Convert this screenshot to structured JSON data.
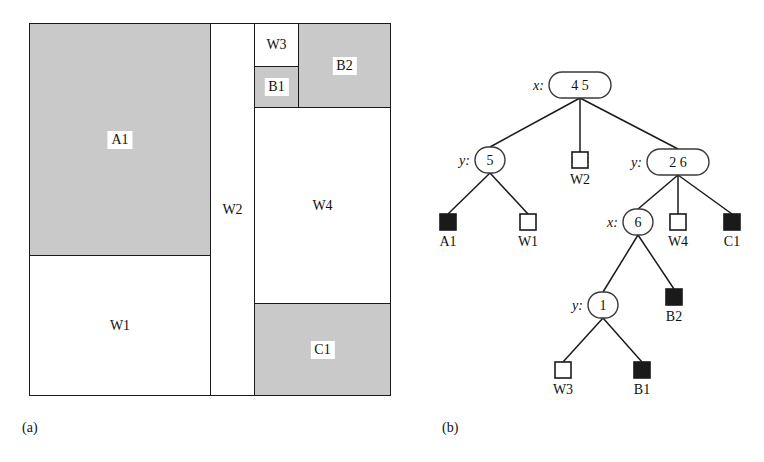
{
  "figure": {
    "panel_a_caption": "(a)",
    "panel_b_caption": "(b)"
  },
  "colors": {
    "shaded_block": "#c9c9c9",
    "outline": "#1a1a1a",
    "background": "#ffffff",
    "filled_leaf": "#1a1a1a"
  },
  "floorplan": {
    "blocks": [
      {
        "id": "A1",
        "label": "A1",
        "shaded": true,
        "x": 29,
        "y": 23,
        "w": 182,
        "h": 233
      },
      {
        "id": "W1",
        "label": "W1",
        "shaded": false,
        "x": 29,
        "y": 255,
        "w": 182,
        "h": 141
      },
      {
        "id": "W2",
        "label": "W2",
        "shaded": false,
        "x": 210,
        "y": 23,
        "w": 45,
        "h": 373
      },
      {
        "id": "W3",
        "label": "W3",
        "shaded": false,
        "x": 254,
        "y": 23,
        "w": 45,
        "h": 44
      },
      {
        "id": "B1",
        "label": "B1",
        "shaded": true,
        "x": 254,
        "y": 66,
        "w": 45,
        "h": 42
      },
      {
        "id": "B2",
        "label": "B2",
        "shaded": true,
        "x": 298,
        "y": 23,
        "w": 93,
        "h": 85
      },
      {
        "id": "W4",
        "label": "W4",
        "shaded": false,
        "x": 254,
        "y": 107,
        "w": 137,
        "h": 197
      },
      {
        "id": "C1",
        "label": "C1",
        "shaded": true,
        "x": 254,
        "y": 303,
        "w": 137,
        "h": 93
      }
    ]
  },
  "tree": {
    "internal_nodes": [
      {
        "id": "root",
        "axis": "x:",
        "values": "4    5",
        "cx": 160,
        "cy": 85,
        "w": 62,
        "h": 26
      },
      {
        "id": "n-y5",
        "axis": "y:",
        "values": "5",
        "cx": 70,
        "cy": 160,
        "w": 30,
        "h": 26
      },
      {
        "id": "n-y26",
        "axis": "y:",
        "values": "2    6",
        "cx": 258,
        "cy": 162,
        "w": 62,
        "h": 26
      },
      {
        "id": "n-x6",
        "axis": "x:",
        "values": "6",
        "cx": 218,
        "cy": 222,
        "w": 30,
        "h": 26
      },
      {
        "id": "n-y1",
        "axis": "y:",
        "values": "1",
        "cx": 183,
        "cy": 305,
        "w": 30,
        "h": 26
      }
    ],
    "leaves": [
      {
        "id": "A1",
        "label": "A1",
        "filled": true,
        "cx": 28,
        "cy": 222,
        "size": 16
      },
      {
        "id": "W1",
        "label": "W1",
        "filled": false,
        "cx": 108,
        "cy": 222,
        "size": 16
      },
      {
        "id": "W2",
        "label": "W2",
        "filled": false,
        "cx": 160,
        "cy": 160,
        "size": 16
      },
      {
        "id": "W4",
        "label": "W4",
        "filled": false,
        "cx": 258,
        "cy": 222,
        "size": 16
      },
      {
        "id": "C1",
        "label": "C1",
        "filled": true,
        "cx": 312,
        "cy": 222,
        "size": 16
      },
      {
        "id": "B2",
        "label": "B2",
        "filled": true,
        "cx": 254,
        "cy": 297,
        "size": 16
      },
      {
        "id": "W3",
        "label": "W3",
        "filled": false,
        "cx": 143,
        "cy": 370,
        "size": 16
      },
      {
        "id": "B1",
        "label": "B1",
        "filled": true,
        "cx": 222,
        "cy": 370,
        "size": 16
      }
    ],
    "edges": [
      {
        "from": "root",
        "to": "n-y5"
      },
      {
        "from": "root",
        "to": "W2"
      },
      {
        "from": "root",
        "to": "n-y26"
      },
      {
        "from": "n-y5",
        "to": "A1"
      },
      {
        "from": "n-y5",
        "to": "W1"
      },
      {
        "from": "n-y26",
        "to": "n-x6"
      },
      {
        "from": "n-y26",
        "to": "W4"
      },
      {
        "from": "n-y26",
        "to": "C1"
      },
      {
        "from": "n-x6",
        "to": "n-y1"
      },
      {
        "from": "n-x6",
        "to": "B2"
      },
      {
        "from": "n-y1",
        "to": "W3"
      },
      {
        "from": "n-y1",
        "to": "B1"
      }
    ]
  }
}
